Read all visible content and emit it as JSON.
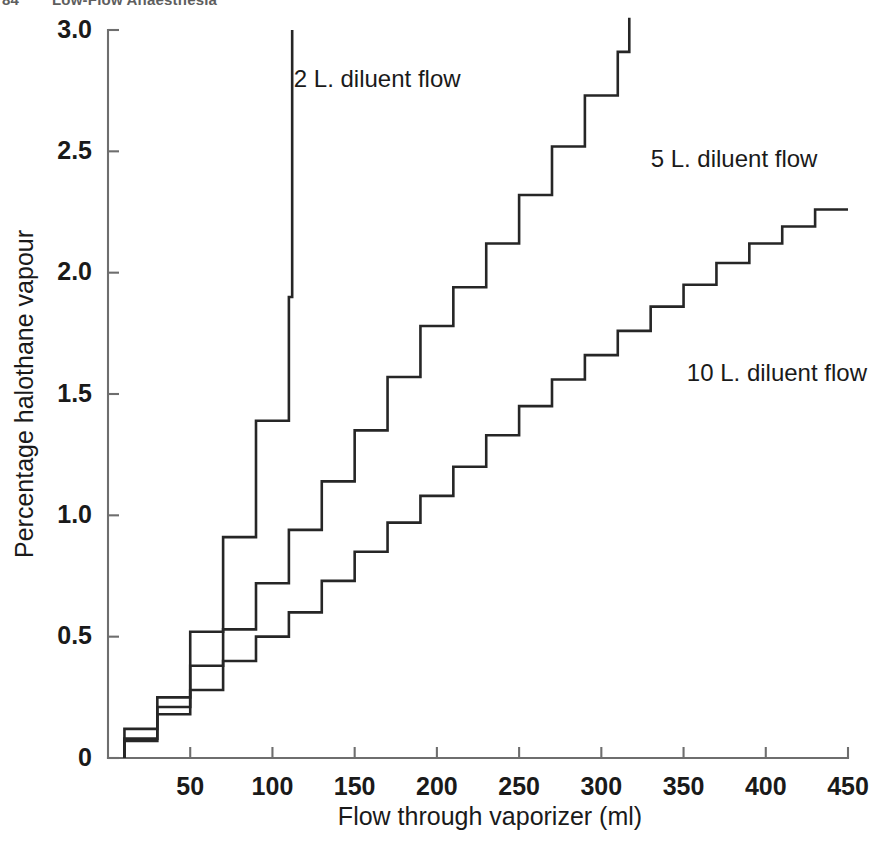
{
  "page": {
    "running_head_number": "84",
    "running_head_title": "Low-Flow Anaesthesia",
    "background_color": "#ffffff",
    "ink_color": "#262626",
    "axis_color": "#6e6e6e"
  },
  "chart_data": {
    "type": "line",
    "subtype": "step",
    "title": "",
    "xlabel": "Flow through vaporizer (ml)",
    "ylabel": "Percentage halothane vapour",
    "xlim": [
      0,
      450
    ],
    "ylim": [
      0,
      3.0
    ],
    "xticks": [
      0,
      50,
      100,
      150,
      200,
      250,
      300,
      350,
      400,
      450
    ],
    "xticklabels": [
      "",
      "50",
      "100",
      "150",
      "200",
      "250",
      "300",
      "350",
      "400",
      "450"
    ],
    "yticks": [
      0,
      0.5,
      1.0,
      1.5,
      2.0,
      2.5,
      3.0
    ],
    "yticklabels": [
      "0",
      "0.5",
      "1.0",
      "1.5",
      "2.0",
      "2.5",
      "3.0"
    ],
    "grid": false,
    "legend": "inline-annotations",
    "series": [
      {
        "name": "2 L. diluent flow",
        "label": "2 L. diluent flow",
        "label_x": 113,
        "label_y": 2.79,
        "step_width_ml": 20,
        "x": [
          10,
          10,
          30,
          30,
          50,
          50,
          70,
          70,
          90,
          90,
          110,
          110
        ],
        "y": [
          0.07,
          0.21,
          0.21,
          0.52,
          0.52,
          0.91,
          0.91,
          1.39,
          1.39,
          1.9,
          1.9,
          2.37
        ],
        "points": [
          {
            "x": 10,
            "y": 0.07
          },
          {
            "x": 30,
            "y": 0.21
          },
          {
            "x": 50,
            "y": 0.52
          },
          {
            "x": 70,
            "y": 0.91
          },
          {
            "x": 90,
            "y": 1.39
          },
          {
            "x": 110,
            "y": 1.9
          },
          {
            "x": 112,
            "y": 2.37
          },
          {
            "x": 112,
            "y": 3.0
          }
        ]
      },
      {
        "name": "5 L. diluent flow",
        "label": "5 L. diluent flow",
        "label_x": 330,
        "label_y": 2.46,
        "step_width_ml": 20,
        "x": [
          10,
          30,
          50,
          70,
          90,
          110,
          130,
          150,
          170,
          190,
          210,
          230,
          250,
          270,
          290,
          310
        ],
        "y": [
          0.12,
          0.25,
          0.38,
          0.53,
          0.72,
          0.94,
          1.14,
          1.35,
          1.57,
          1.78,
          1.94,
          2.12,
          2.32,
          2.52,
          2.73,
          2.91
        ],
        "points": [
          {
            "x": 10,
            "y": 0.12
          },
          {
            "x": 30,
            "y": 0.25
          },
          {
            "x": 50,
            "y": 0.38
          },
          {
            "x": 70,
            "y": 0.53
          },
          {
            "x": 90,
            "y": 0.72
          },
          {
            "x": 110,
            "y": 0.94
          },
          {
            "x": 130,
            "y": 1.14
          },
          {
            "x": 150,
            "y": 1.35
          },
          {
            "x": 170,
            "y": 1.57
          },
          {
            "x": 190,
            "y": 1.78
          },
          {
            "x": 210,
            "y": 1.94
          },
          {
            "x": 230,
            "y": 2.12
          },
          {
            "x": 250,
            "y": 2.32
          },
          {
            "x": 270,
            "y": 2.52
          },
          {
            "x": 290,
            "y": 2.73
          },
          {
            "x": 310,
            "y": 2.91
          },
          {
            "x": 317,
            "y": 3.05
          }
        ]
      },
      {
        "name": "10 L. diluent flow",
        "label": "10 L. diluent flow",
        "label_x": 352,
        "label_y": 1.58,
        "step_width_ml": 20,
        "x": [
          10,
          30,
          50,
          70,
          90,
          110,
          130,
          150,
          170,
          190,
          210,
          230,
          250,
          270,
          290,
          310,
          330,
          350,
          370,
          390,
          410,
          430
        ],
        "y": [
          0.08,
          0.18,
          0.28,
          0.4,
          0.5,
          0.6,
          0.73,
          0.85,
          0.97,
          1.08,
          1.2,
          1.33,
          1.45,
          1.56,
          1.66,
          1.76,
          1.86,
          1.95,
          2.04,
          2.12,
          2.19,
          2.26
        ],
        "points": [
          {
            "x": 10,
            "y": 0.08
          },
          {
            "x": 30,
            "y": 0.18
          },
          {
            "x": 50,
            "y": 0.28
          },
          {
            "x": 70,
            "y": 0.4
          },
          {
            "x": 90,
            "y": 0.5
          },
          {
            "x": 110,
            "y": 0.6
          },
          {
            "x": 130,
            "y": 0.73
          },
          {
            "x": 150,
            "y": 0.85
          },
          {
            "x": 170,
            "y": 0.97
          },
          {
            "x": 190,
            "y": 1.08
          },
          {
            "x": 210,
            "y": 1.2
          },
          {
            "x": 230,
            "y": 1.33
          },
          {
            "x": 250,
            "y": 1.45
          },
          {
            "x": 270,
            "y": 1.56
          },
          {
            "x": 290,
            "y": 1.66
          },
          {
            "x": 310,
            "y": 1.76
          },
          {
            "x": 330,
            "y": 1.86
          },
          {
            "x": 350,
            "y": 1.95
          },
          {
            "x": 370,
            "y": 2.04
          },
          {
            "x": 390,
            "y": 2.12
          },
          {
            "x": 410,
            "y": 2.19
          },
          {
            "x": 430,
            "y": 2.26
          },
          {
            "x": 450,
            "y": 2.26
          }
        ]
      }
    ]
  },
  "geometry": {
    "plot_left": 108,
    "plot_right": 848,
    "plot_top": 30,
    "plot_bottom": 758,
    "y_tick_len": 11,
    "x_tick_len": 11,
    "xlabel_y": 825,
    "ylabel_x": 33
  }
}
